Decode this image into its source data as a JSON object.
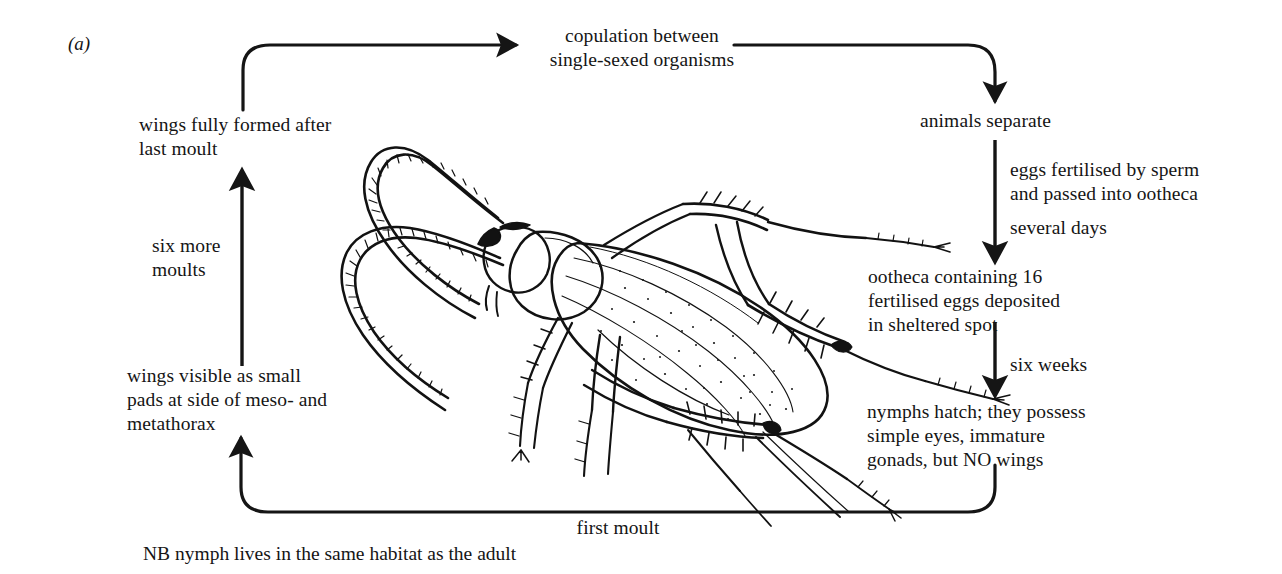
{
  "figure": {
    "panel_label": "(a)",
    "caption_note": "NB nymph lives in the same habitat as the adult"
  },
  "nodes": {
    "copulation": "copulation between\nsingle-sexed organisms",
    "animals_separate": "animals separate",
    "ootheca_deposited": "ootheca containing 16\nfertilised eggs deposited\nin sheltered spot",
    "nymphs_hatch": "nymphs hatch; they possess\nsimple eyes, immature\ngonads, but NO wings",
    "wings_visible": "wings visible as small\npads at side of meso- and\nmetathorax",
    "wings_formed": "wings fully formed after\nlast moult"
  },
  "edges": {
    "eggs_fertilised": "eggs fertilised by sperm\nand passed into ootheca",
    "several_days": "several days",
    "six_weeks": "six weeks",
    "first_moult": "first moult",
    "six_more_moults": "six more\nmoults"
  },
  "illustration": {
    "subject": "cockroach-line-drawing"
  },
  "colors": {
    "ink": "#151515",
    "background": "#ffffff"
  }
}
